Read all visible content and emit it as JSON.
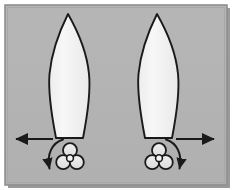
{
  "figure": {
    "caption": "",
    "background_color": "#ffffff",
    "panel": {
      "fill_color": "#b3b3b3",
      "border_color": "#8c8c8c",
      "shadow_color": "#7a7a7a",
      "x": 5,
      "y": 5,
      "width": 222,
      "height": 180
    }
  },
  "hulls": [
    {
      "name": "left-hull",
      "label": "",
      "fill_color": "#f2f2f2",
      "stroke_color": "#1a1a1a",
      "bow_tip_x": 68,
      "bow_tip_y": 14,
      "stern_y": 138,
      "stern_left_x": 56,
      "stern_right_x": 83,
      "max_beam_x_left": 49,
      "max_beam_x_right": 88,
      "max_beam_y": 78
    },
    {
      "name": "right-hull",
      "label": "",
      "fill_color": "#f2f2f2",
      "stroke_color": "#1a1a1a",
      "bow_tip_x": 157,
      "bow_tip_y": 14,
      "stern_y": 138,
      "stern_left_x": 145,
      "stern_right_x": 172,
      "max_beam_x_left": 138,
      "max_beam_x_right": 177,
      "max_beam_y": 78
    }
  ],
  "propellers": [
    {
      "name": "left-propeller",
      "label": "",
      "center_x": 70,
      "center_y": 158,
      "blade_count": 3,
      "blade_radius": 7.5,
      "hub_radius": 3.2,
      "fill_color": "#e6e6e6",
      "stroke_color": "#1a1a1a"
    },
    {
      "name": "right-propeller",
      "label": "",
      "center_x": 159,
      "center_y": 158,
      "blade_count": 3,
      "blade_radius": 7.5,
      "hub_radius": 3.2,
      "fill_color": "#e6e6e6",
      "stroke_color": "#1a1a1a"
    }
  ],
  "rotation_arrows": [
    {
      "name": "left-rotation-arrow",
      "label": "",
      "direction": "counter-clockwise",
      "color": "#1a1a1a",
      "description": "curved arrow sweeping from upper-right down to lower-left around left propeller"
    },
    {
      "name": "right-rotation-arrow",
      "label": "",
      "direction": "clockwise",
      "color": "#1a1a1a",
      "description": "curved arrow sweeping from upper-left down to lower-right around right propeller"
    }
  ],
  "thrust_arrows": [
    {
      "name": "left-thrust-arrow",
      "label": "",
      "direction": "left",
      "color": "#1a1a1a",
      "tail_x": 53,
      "head_x": 12,
      "y": 139
    },
    {
      "name": "right-thrust-arrow",
      "label": "",
      "direction": "right",
      "color": "#1a1a1a",
      "tail_x": 176,
      "head_x": 220,
      "y": 139
    }
  ]
}
